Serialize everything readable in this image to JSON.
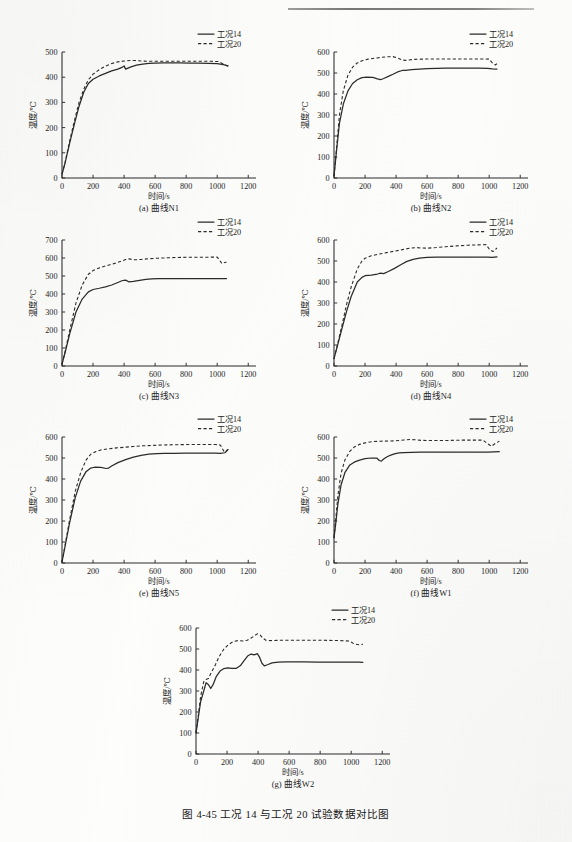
{
  "page": {
    "figure_caption": "图 4-45    工况 14 与工况 20 试验数据对比图"
  },
  "common": {
    "xlabel": "时间/s",
    "ylabel": "温度/℃",
    "legend": [
      {
        "label": "工况14",
        "style": "solid"
      },
      {
        "label": "工况20",
        "style": "dashed"
      }
    ],
    "xticks": [
      0,
      200,
      400,
      600,
      800,
      1000,
      1200
    ],
    "xlim": [
      0,
      1250
    ]
  },
  "chart_data": [
    {
      "id": "a",
      "type": "line",
      "caption": "(a)  曲线N1",
      "title": "",
      "xlabel": "时间/s",
      "ylabel": "温度/℃",
      "xlim": [
        0,
        1250
      ],
      "ylim": [
        0,
        500
      ],
      "xticks": [
        0,
        200,
        400,
        600,
        800,
        1000,
        1200
      ],
      "yticks": [
        0,
        100,
        200,
        300,
        400,
        500
      ],
      "grid": false,
      "legend_position": "top-right-outside",
      "series": [
        {
          "name": "工况14",
          "style": "solid",
          "x": [
            0,
            20,
            50,
            80,
            110,
            140,
            170,
            200,
            240,
            280,
            320,
            360,
            390,
            400,
            410,
            440,
            480,
            520,
            560,
            600,
            650,
            700,
            760,
            820,
            880,
            940,
            1000,
            1040,
            1070
          ],
          "values": [
            15,
            60,
            140,
            215,
            285,
            340,
            375,
            392,
            405,
            415,
            425,
            432,
            440,
            445,
            432,
            440,
            448,
            452,
            455,
            456,
            457,
            457,
            457,
            456,
            456,
            455,
            454,
            450,
            445
          ]
        },
        {
          "name": "工况20",
          "style": "dashed",
          "x": [
            0,
            20,
            50,
            80,
            110,
            140,
            170,
            200,
            240,
            280,
            320,
            360,
            400,
            440,
            470,
            520,
            560,
            600,
            660,
            720,
            780,
            840,
            900,
            960,
            1010,
            1040,
            1070
          ],
          "values": [
            15,
            62,
            148,
            228,
            300,
            352,
            390,
            412,
            430,
            444,
            454,
            461,
            464,
            466,
            466,
            464,
            463,
            463,
            463,
            463,
            463,
            463,
            463,
            463,
            462,
            452,
            443
          ]
        }
      ]
    },
    {
      "id": "b",
      "type": "line",
      "caption": "(b)  曲线N2",
      "title": "",
      "xlabel": "时间/s",
      "ylabel": "温度/℃",
      "xlim": [
        0,
        1250
      ],
      "ylim": [
        0,
        600
      ],
      "xticks": [
        0,
        200,
        400,
        600,
        800,
        1000,
        1200
      ],
      "yticks": [
        0,
        100,
        200,
        300,
        400,
        500,
        600
      ],
      "grid": false,
      "legend_position": "top-right-outside",
      "series": [
        {
          "name": "工况14",
          "style": "solid",
          "x": [
            0,
            15,
            35,
            60,
            90,
            120,
            150,
            180,
            210,
            250,
            280,
            300,
            320,
            350,
            380,
            410,
            440,
            460,
            500,
            550,
            600,
            660,
            720,
            790,
            860,
            930,
            990,
            1020,
            1050
          ],
          "values": [
            10,
            120,
            260,
            352,
            415,
            450,
            468,
            478,
            480,
            479,
            472,
            468,
            474,
            484,
            494,
            505,
            512,
            513,
            516,
            519,
            521,
            522,
            523,
            523,
            523,
            523,
            522,
            520,
            519
          ]
        },
        {
          "name": "工况20",
          "style": "dashed",
          "x": [
            0,
            15,
            35,
            60,
            90,
            120,
            150,
            180,
            220,
            260,
            300,
            340,
            380,
            410,
            440,
            460,
            480,
            520,
            560,
            620,
            680,
            740,
            800,
            870,
            940,
            1000,
            1020,
            1040,
            1060
          ],
          "values": [
            10,
            130,
            300,
            415,
            490,
            528,
            548,
            558,
            566,
            570,
            574,
            577,
            578,
            572,
            562,
            560,
            562,
            565,
            566,
            567,
            567,
            567,
            567,
            567,
            567,
            566,
            548,
            538,
            552
          ]
        }
      ]
    },
    {
      "id": "c",
      "type": "line",
      "caption": "(c)  曲线N3",
      "title": "",
      "xlabel": "时间/s",
      "ylabel": "温度/℃",
      "xlim": [
        0,
        1250
      ],
      "ylim": [
        0,
        700
      ],
      "xticks": [
        0,
        200,
        400,
        600,
        800,
        1000,
        1200
      ],
      "yticks": [
        0,
        100,
        200,
        300,
        400,
        500,
        600,
        700
      ],
      "grid": false,
      "legend_position": "top-right-outside",
      "series": [
        {
          "name": "工况14",
          "style": "solid",
          "x": [
            0,
            20,
            50,
            90,
            130,
            170,
            200,
            240,
            280,
            320,
            360,
            390,
            410,
            430,
            460,
            500,
            540,
            580,
            620,
            680,
            740,
            800,
            860,
            920,
            980,
            1020,
            1060
          ],
          "values": [
            10,
            75,
            180,
            300,
            372,
            412,
            425,
            432,
            440,
            450,
            464,
            475,
            477,
            468,
            470,
            476,
            481,
            484,
            485,
            485,
            485,
            485,
            485,
            485,
            485,
            486,
            486
          ]
        },
        {
          "name": "工况20",
          "style": "dashed",
          "x": [
            0,
            20,
            50,
            90,
            130,
            170,
            200,
            240,
            290,
            340,
            380,
            410,
            430,
            450,
            470,
            510,
            560,
            620,
            680,
            740,
            800,
            860,
            920,
            970,
            1000,
            1030,
            1060
          ],
          "values": [
            10,
            80,
            200,
            350,
            450,
            510,
            530,
            545,
            558,
            570,
            582,
            592,
            595,
            592,
            590,
            592,
            596,
            599,
            601,
            603,
            604,
            604,
            604,
            605,
            605,
            570,
            578
          ]
        }
      ]
    },
    {
      "id": "d",
      "type": "line",
      "caption": "(d)  曲线N4",
      "title": "",
      "xlabel": "时间/s",
      "ylabel": "温度/℃",
      "xlim": [
        0,
        1250
      ],
      "ylim": [
        0,
        600
      ],
      "xticks": [
        0,
        200,
        400,
        600,
        800,
        1000,
        1200
      ],
      "yticks": [
        0,
        100,
        200,
        300,
        400,
        500,
        600
      ],
      "grid": false,
      "legend_position": "top-right-outside",
      "series": [
        {
          "name": "工况14",
          "style": "solid",
          "x": [
            0,
            20,
            50,
            80,
            110,
            150,
            180,
            200,
            240,
            280,
            300,
            320,
            350,
            390,
            430,
            470,
            510,
            550,
            600,
            660,
            720,
            790,
            860,
            930,
            990,
            1020,
            1050
          ],
          "values": [
            35,
            90,
            175,
            258,
            330,
            400,
            422,
            430,
            433,
            438,
            442,
            440,
            450,
            465,
            482,
            498,
            508,
            514,
            517,
            518,
            519,
            519,
            519,
            519,
            518,
            517,
            520
          ]
        },
        {
          "name": "工况20",
          "style": "dashed",
          "x": [
            0,
            20,
            50,
            80,
            110,
            150,
            180,
            200,
            240,
            290,
            340,
            390,
            440,
            490,
            530,
            560,
            600,
            660,
            720,
            790,
            860,
            930,
            980,
            1005,
            1025,
            1050
          ],
          "values": [
            35,
            95,
            190,
            290,
            375,
            462,
            500,
            513,
            525,
            533,
            540,
            547,
            554,
            561,
            564,
            562,
            561,
            564,
            568,
            572,
            575,
            577,
            578,
            552,
            545,
            562
          ]
        }
      ]
    },
    {
      "id": "e",
      "type": "line",
      "caption": "(e)  曲线N5",
      "title": "",
      "xlabel": "时间/s",
      "ylabel": "温度/℃",
      "xlim": [
        0,
        1250
      ],
      "ylim": [
        0,
        600
      ],
      "xticks": [
        0,
        200,
        400,
        600,
        800,
        1000,
        1200
      ],
      "yticks": [
        0,
        100,
        200,
        300,
        400,
        500,
        600
      ],
      "grid": false,
      "legend_position": "top-right-outside",
      "series": [
        {
          "name": "工况14",
          "style": "solid",
          "x": [
            0,
            20,
            50,
            85,
            120,
            155,
            185,
            210,
            250,
            285,
            300,
            320,
            360,
            410,
            460,
            510,
            560,
            610,
            660,
            720,
            790,
            860,
            930,
            990,
            1020,
            1050,
            1070
          ],
          "values": [
            5,
            80,
            195,
            310,
            390,
            435,
            452,
            456,
            455,
            450,
            452,
            462,
            478,
            492,
            504,
            513,
            518,
            521,
            522,
            522,
            523,
            523,
            523,
            523,
            522,
            525,
            540
          ]
        },
        {
          "name": "工况20",
          "style": "dashed",
          "x": [
            0,
            20,
            50,
            85,
            120,
            155,
            185,
            210,
            250,
            300,
            350,
            400,
            460,
            520,
            580,
            650,
            720,
            790,
            860,
            930,
            990,
            1020,
            1045,
            1070
          ],
          "values": [
            5,
            85,
            210,
            340,
            430,
            490,
            518,
            528,
            538,
            544,
            548,
            551,
            555,
            558,
            560,
            562,
            563,
            564,
            564,
            564,
            564,
            562,
            530,
            540
          ]
        }
      ]
    },
    {
      "id": "f",
      "type": "line",
      "caption": "(f)  曲线W1",
      "title": "",
      "xlabel": "时间/s",
      "ylabel": "温度/℃",
      "xlim": [
        0,
        1250
      ],
      "ylim": [
        0,
        600
      ],
      "xticks": [
        0,
        200,
        400,
        600,
        800,
        1000,
        1200
      ],
      "yticks": [
        0,
        100,
        200,
        300,
        400,
        500,
        600
      ],
      "grid": false,
      "legend_position": "top-right-outside",
      "series": [
        {
          "name": "工况14",
          "style": "solid",
          "x": [
            0,
            10,
            25,
            45,
            70,
            100,
            130,
            165,
            200,
            240,
            275,
            292,
            305,
            320,
            345,
            370,
            395,
            420,
            450,
            500,
            560,
            630,
            700,
            780,
            860,
            930,
            990,
            1030,
            1065
          ],
          "values": [
            120,
            180,
            280,
            370,
            430,
            465,
            480,
            490,
            497,
            500,
            500,
            488,
            485,
            495,
            507,
            515,
            521,
            524,
            526,
            527,
            528,
            528,
            528,
            528,
            528,
            528,
            528,
            529,
            530
          ]
        },
        {
          "name": "工况20",
          "style": "dashed",
          "x": [
            0,
            10,
            25,
            45,
            70,
            100,
            130,
            165,
            200,
            250,
            300,
            350,
            400,
            450,
            490,
            520,
            560,
            620,
            690,
            760,
            830,
            900,
            960,
            990,
            1015,
            1040,
            1065
          ],
          "values": [
            120,
            200,
            320,
            425,
            490,
            530,
            552,
            565,
            572,
            578,
            580,
            581,
            582,
            586,
            588,
            587,
            584,
            583,
            583,
            584,
            585,
            585,
            585,
            568,
            556,
            570,
            580
          ]
        }
      ]
    },
    {
      "id": "g",
      "type": "line",
      "caption": "(g)  曲线W2",
      "title": "",
      "xlabel": "时间/s",
      "ylabel": "温度/℃",
      "xlim": [
        0,
        1250
      ],
      "ylim": [
        0,
        600
      ],
      "xticks": [
        0,
        200,
        400,
        600,
        800,
        1000,
        1200
      ],
      "yticks": [
        0,
        100,
        200,
        300,
        400,
        500,
        600
      ],
      "grid": false,
      "legend_position": "top-right-outside",
      "series": [
        {
          "name": "工况14",
          "style": "solid",
          "x": [
            0,
            15,
            30,
            50,
            65,
            80,
            95,
            110,
            130,
            155,
            180,
            205,
            230,
            260,
            285,
            310,
            335,
            355,
            375,
            395,
            410,
            425,
            440,
            460,
            490,
            530,
            580,
            640,
            700,
            780,
            860,
            930,
            1000,
            1050,
            1075
          ],
          "values": [
            100,
            175,
            250,
            300,
            340,
            330,
            312,
            330,
            368,
            395,
            407,
            410,
            408,
            408,
            420,
            445,
            468,
            476,
            472,
            478,
            460,
            432,
            420,
            425,
            434,
            438,
            439,
            439,
            439,
            438,
            438,
            438,
            437,
            437,
            436
          ]
        },
        {
          "name": "工况20",
          "style": "dashed",
          "x": [
            0,
            15,
            30,
            50,
            65,
            80,
            100,
            125,
            150,
            180,
            210,
            240,
            270,
            300,
            330,
            355,
            375,
            395,
            412,
            430,
            450,
            480,
            520,
            570,
            630,
            700,
            780,
            860,
            930,
            990,
            1020,
            1050,
            1075
          ],
          "values": [
            100,
            185,
            275,
            345,
            355,
            360,
            390,
            425,
            465,
            500,
            522,
            535,
            540,
            538,
            542,
            552,
            562,
            572,
            568,
            552,
            542,
            540,
            541,
            542,
            542,
            542,
            542,
            541,
            540,
            538,
            524,
            520,
            522
          ]
        }
      ]
    }
  ]
}
